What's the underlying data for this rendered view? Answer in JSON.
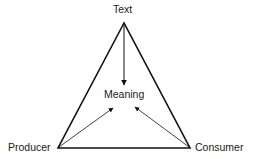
{
  "diagram": {
    "type": "triangle-model",
    "nodes": {
      "top": "Text",
      "center": "Meaning",
      "bottom_left": "Producer",
      "bottom_right": "Consumer"
    },
    "edges": [
      {
        "from": "Text",
        "to": "Meaning",
        "style": "arrow"
      },
      {
        "from": "Producer",
        "to": "Meaning",
        "style": "arrow"
      },
      {
        "from": "Consumer",
        "to": "Meaning",
        "style": "arrow"
      },
      {
        "from": "Text",
        "to": "Producer",
        "style": "line"
      },
      {
        "from": "Text",
        "to": "Consumer",
        "style": "line"
      },
      {
        "from": "Producer",
        "to": "Consumer",
        "style": "line"
      }
    ],
    "colors": {
      "stroke": "#111111",
      "background": "#ffffff"
    }
  }
}
